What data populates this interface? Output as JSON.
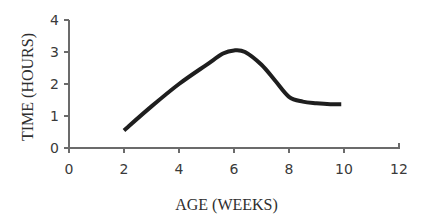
{
  "chart_data": {
    "type": "line",
    "title": "",
    "xlabel": "AGE (WEEKS)",
    "ylabel": "TIME (HOURS)",
    "xlim": [
      0,
      12
    ],
    "ylim": [
      0,
      4
    ],
    "x_ticks": [
      0,
      2,
      4,
      6,
      8,
      10,
      12
    ],
    "y_ticks": [
      0,
      1,
      2,
      3,
      4
    ],
    "grid": false,
    "legend": null,
    "series": [
      {
        "name": "Time",
        "color": "#1e1e1e",
        "x": [
          2,
          3,
          4,
          5,
          5.6,
          6,
          6.4,
          7,
          7.5,
          8,
          8.5,
          9,
          9.5,
          9.9
        ],
        "y": [
          0.55,
          1.3,
          2.0,
          2.6,
          2.95,
          3.05,
          3.0,
          2.6,
          2.1,
          1.6,
          1.45,
          1.4,
          1.37,
          1.37
        ]
      }
    ]
  }
}
